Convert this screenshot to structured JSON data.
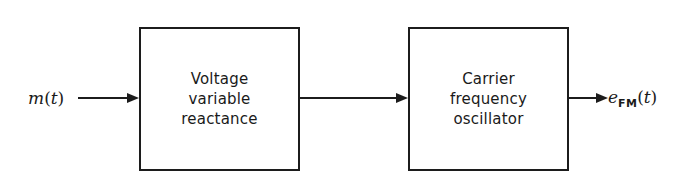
{
  "diagram": {
    "background_color": "#ffffff",
    "line_color": "#1c1c1c",
    "text_color": "#1a1a1a",
    "blocks": [
      {
        "id": "voltage-variable-reactance",
        "lines": [
          "Voltage",
          "variable",
          "reactance"
        ]
      },
      {
        "id": "carrier-frequency-oscillator",
        "lines": [
          "Carrier",
          "frequency",
          "oscillator"
        ]
      }
    ],
    "signals": {
      "input": {
        "base": "m",
        "subscript": "",
        "argument": "(t)",
        "full_text": "m(t)"
      },
      "output": {
        "base": "e",
        "subscript": "FM",
        "argument": "(t)",
        "full_text": "e_FM(t)"
      }
    },
    "connectors": [
      {
        "id": "input-arrow",
        "from": "m(t)",
        "to": "Voltage variable reactance",
        "arrowhead": "right"
      },
      {
        "id": "middle-arrow",
        "from": "Voltage variable reactance",
        "to": "Carrier frequency oscillator",
        "arrowhead": "right"
      },
      {
        "id": "output-arrow",
        "from": "Carrier frequency oscillator",
        "to": "e_FM(t)",
        "arrowhead": "right"
      }
    ]
  }
}
